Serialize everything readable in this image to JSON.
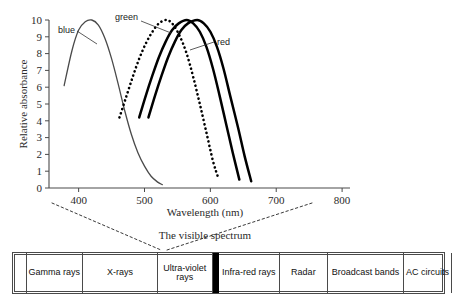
{
  "chart_data": {
    "type": "line",
    "title": "",
    "xlabel": "Wavelength (nm)",
    "ylabel": "Relative absorbance",
    "xlim": [
      355,
      812
    ],
    "ylim": [
      0,
      10
    ],
    "xticks": [
      400,
      500,
      600,
      700,
      800
    ],
    "yticks": [
      0,
      1,
      2,
      3,
      4,
      5,
      6,
      7,
      8,
      9,
      10
    ],
    "grid": false,
    "legend_position": "inline-leader-labels",
    "series": [
      {
        "name": "blue",
        "style": "thin-solid",
        "color": "#4a4a4a",
        "peak_x": 420,
        "peak_y": 10,
        "x": [
          378,
          390,
          400,
          410,
          420,
          430,
          440,
          450,
          460,
          470,
          480,
          490,
          500,
          510,
          520,
          527
        ],
        "y": [
          6.1,
          8.2,
          9.4,
          9.9,
          10.0,
          9.7,
          8.9,
          7.7,
          6.2,
          4.6,
          3.2,
          2.1,
          1.3,
          0.7,
          0.35,
          0.2
        ]
      },
      {
        "name": "green",
        "style": "dotted",
        "color": "#000000",
        "peak_x": 534,
        "peak_y": 10,
        "x": [
          462,
          472,
          482,
          492,
          502,
          512,
          522,
          534,
          544,
          554,
          564,
          574,
          584,
          594,
          604,
          612
        ],
        "y": [
          4.2,
          5.4,
          6.6,
          7.7,
          8.6,
          9.3,
          9.8,
          10.0,
          9.7,
          9.0,
          8.0,
          6.6,
          5.0,
          3.3,
          1.6,
          0.6
        ]
      },
      {
        "name": "red",
        "style": "thick-solid",
        "color": "#000000",
        "peak_x": 564,
        "peak_y": 10,
        "x": [
          492,
          502,
          512,
          522,
          532,
          542,
          552,
          564,
          574,
          584,
          594,
          604,
          614,
          624,
          634,
          644
        ],
        "y": [
          4.2,
          5.5,
          6.7,
          7.8,
          8.7,
          9.4,
          9.8,
          10.0,
          9.8,
          9.3,
          8.4,
          7.1,
          5.5,
          3.8,
          2.1,
          0.5
        ]
      },
      {
        "name": "red-2",
        "style": "thick-solid",
        "color": "#000000",
        "peak_x": 580,
        "peak_y": 10,
        "x": [
          506,
          516,
          526,
          536,
          546,
          556,
          566,
          580,
          590,
          600,
          610,
          620,
          630,
          642,
          652,
          662
        ],
        "y": [
          4.2,
          5.5,
          6.7,
          7.8,
          8.7,
          9.4,
          9.8,
          10.0,
          9.8,
          9.3,
          8.4,
          7.1,
          5.5,
          3.6,
          1.9,
          0.4
        ]
      }
    ],
    "annotations": [
      {
        "text": "blue",
        "target_series": "blue"
      },
      {
        "text": "green",
        "target_series": "red"
      },
      {
        "text": "red",
        "target_series": "red-2"
      }
    ]
  },
  "axis": {
    "y_label": "Relative absorbance",
    "x_label": "Wavelength (nm)",
    "y_ticks": [
      "10",
      "9",
      "8",
      "7",
      "6",
      "5",
      "4",
      "3",
      "2",
      "1",
      "0"
    ],
    "x_ticks": [
      "400",
      "500",
      "600",
      "700",
      "800"
    ]
  },
  "labels": {
    "blue": "blue",
    "green": "green",
    "red": "red"
  },
  "spectrum": {
    "caption": "The visible spectrum",
    "bands": [
      {
        "label": "",
        "kind": "blank"
      },
      {
        "label": "Gamma rays",
        "kind": "text"
      },
      {
        "label": "X-rays",
        "kind": "text"
      },
      {
        "label": "Ultra-violet rays",
        "kind": "text"
      },
      {
        "label": "",
        "kind": "visible-marker"
      },
      {
        "label": "Infra-red rays",
        "kind": "text"
      },
      {
        "label": "Radar",
        "kind": "text"
      },
      {
        "label": "Broadcast bands",
        "kind": "text"
      },
      {
        "label": "AC circuits",
        "kind": "text"
      },
      {
        "label": "",
        "kind": "blank"
      }
    ]
  },
  "colors": {
    "axis": "#4a4a4a",
    "blue_curve": "#4a4a4a",
    "dark_curve": "#000000",
    "band_border": "#4a4a4a",
    "marker": "#000000"
  }
}
